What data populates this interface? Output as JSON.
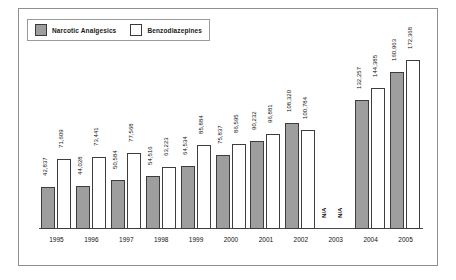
{
  "legend": {
    "items": [
      {
        "label": "Narcotic Analgesics",
        "color": "#9e9e9e",
        "key": "narcotic"
      },
      {
        "label": "Benzodiazepines",
        "color": "#ffffff",
        "key": "benzo"
      }
    ]
  },
  "chart_data": {
    "type": "bar",
    "title": "",
    "xlabel": "",
    "ylabel": "",
    "grid": false,
    "legend_position": "top-left",
    "axis_visible": {
      "x": true,
      "y": false
    },
    "ylim": [
      0,
      180000
    ],
    "categories": [
      "1995",
      "1996",
      "1997",
      "1998",
      "1999",
      "2000",
      "2001",
      "2002",
      "2003",
      "2004",
      "2005"
    ],
    "series": [
      {
        "name": "Narcotic Analgesics",
        "values": [
          42837,
          44028,
          50584,
          54516,
          64534,
          75837,
          90232,
          108320,
          null,
          132257,
          160963
        ],
        "labels": [
          "42,837",
          "44,028",
          "50,584",
          "54,516",
          "64,534",
          "75,837",
          "90,232",
          "108,320",
          "N/A",
          "132,257",
          "160,963"
        ]
      },
      {
        "name": "Benzodiazepines",
        "values": [
          71609,
          73441,
          77568,
          63223,
          85884,
          86595,
          96881,
          100784,
          null,
          144385,
          172368
        ],
        "labels": [
          "71,609",
          "73,441",
          "77,568",
          "63,223",
          "85,884",
          "86,595",
          "96,881",
          "100,784",
          "N/A",
          "144,385",
          "172,368"
        ]
      }
    ]
  },
  "colors": {
    "narcotic_fill": "#9e9e9e",
    "benzo_fill": "#ffffff",
    "bar_stroke": "#3d3d3d",
    "frame": "#909090",
    "axis": "#4a4a4a",
    "text": "#111111"
  }
}
